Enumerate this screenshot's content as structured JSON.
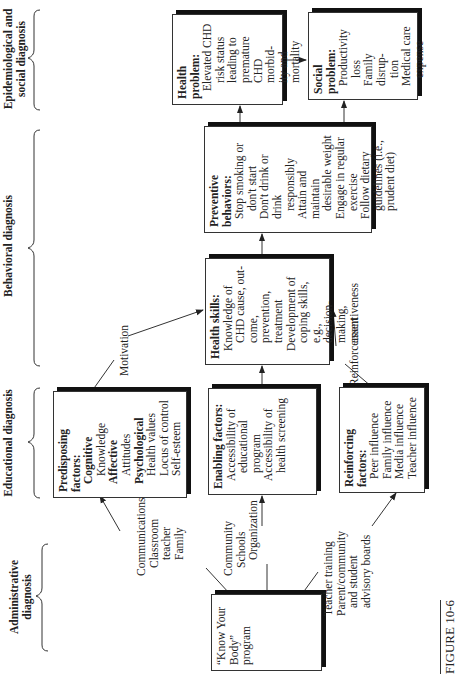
{
  "headers": {
    "administrative": "Administrative diagnosis",
    "educational": "Educational diagnosis",
    "behavioral": "Behavioral diagnosis",
    "epidemiological": "Epidemiological and social diagnosis"
  },
  "boxes": {
    "program": {
      "lines": [
        "“Know Your",
        "Body”",
        "program"
      ]
    },
    "predisposing": {
      "title": [
        "Predisposing",
        "factors:"
      ],
      "groups": [
        {
          "name": "Cognitive",
          "items": [
            "Knowledge"
          ]
        },
        {
          "name": "Affective",
          "items": [
            "Attitudes"
          ]
        },
        {
          "name": "Psychological",
          "items": [
            "Health values",
            "Locus of control",
            "Self-esteem"
          ]
        }
      ]
    },
    "enabling": {
      "title": "Enabling factors:",
      "lines": [
        "Accessibility of",
        "educational",
        "program",
        "Accessibility of",
        "health screening"
      ]
    },
    "reinforcing": {
      "title": [
        "Reinforcing",
        "factors:"
      ],
      "items": [
        "Peer influence",
        "Family influence",
        "Media influence",
        "Teacher influence"
      ]
    },
    "health_skills": {
      "title": "Health skills:",
      "lines": [
        "Knowledge of",
        "CHD cause, out-",
        "come, prevention,",
        "treatment",
        "Development of",
        "coping skills, e.g.,",
        "decision-making,",
        "assertiveness"
      ]
    },
    "preventive": {
      "title": [
        "Preventive",
        "behaviors:"
      ],
      "lines": [
        "Stop smoking or",
        "don't start",
        "Don't drink or drink",
        "responsibly",
        "Attain and maintain",
        "desirable weight",
        "Engage in regular",
        "exercise",
        "Follow dietary",
        "guidelines (i.e.,",
        "prudent diet)"
      ]
    },
    "health_problem": {
      "title": "Health problem:",
      "lines": [
        "Elevated CHD",
        "risk status",
        "leading to",
        "premature",
        "CHD morbid-",
        "ity and",
        "mortality"
      ]
    },
    "social_problem": {
      "title": "Social problem:",
      "lines": [
        "Productivity",
        "loss",
        "Family disrup-",
        "tion",
        "Medical care",
        "expense"
      ]
    }
  },
  "connectors": {
    "to_predisposing": [
      "Communications",
      "Classroom",
      "teacher",
      "Family"
    ],
    "to_enabling": [
      "Community",
      "Schools",
      "Organization"
    ],
    "to_reinforcing": [
      "Teacher training",
      "Parent/community",
      "and student",
      "advisory boards"
    ],
    "motivation": "Motivation",
    "reinforcement": "Reinforcement"
  },
  "figure_label": "FIGURE 10-6"
}
